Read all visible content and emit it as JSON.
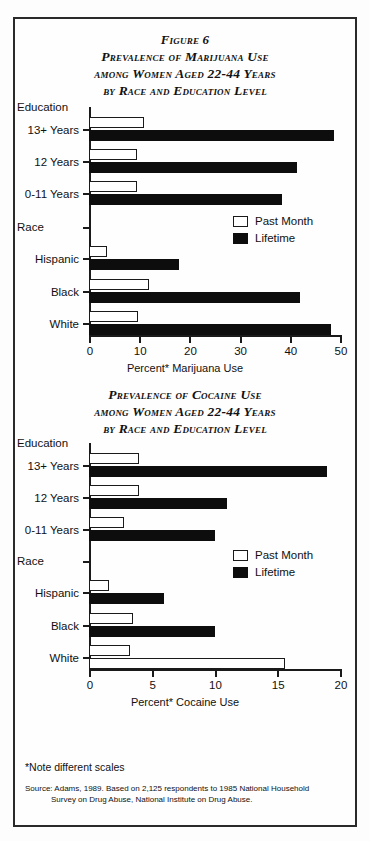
{
  "figure": {
    "number_label": "Figure 6",
    "title_lines": [
      "Prevalence of Marijuana Use",
      "among Women Aged 22-44 Years",
      "by Race and Education Level"
    ]
  },
  "chart2_title_lines": [
    "Prevalence of Cocaine Use",
    "among Women Aged 22-44 Years",
    "by Race and Education Level"
  ],
  "legend": {
    "past_month": "Past Month",
    "lifetime": "Lifetime"
  },
  "groups": {
    "education": "Education",
    "race": "Race"
  },
  "notes": {
    "scales_note": "*Note different scales",
    "source_lead": "Source: Adams, 1989. Based on 2,125 respondents to 1985 National Household",
    "source_cont": "Survey on Drug Abuse, National Institute on Drug Abuse."
  },
  "colors": {
    "lifetime_fill": "#0d0d0d",
    "past_month_fill": "#ffffff",
    "axis": "#1a1a1a",
    "frame": "#2a2a2a"
  },
  "chart_data": [
    {
      "type": "bar",
      "orientation": "horizontal",
      "title": "Prevalence of Marijuana Use among Women Aged 22-44 Years by Race and Education Level",
      "xlabel": "Percent* Marijuana Use",
      "ylabel": "",
      "xlim": [
        0,
        50
      ],
      "xticks": [
        0,
        10,
        20,
        30,
        40,
        50
      ],
      "xtick_labels": [
        "0",
        "10",
        "20",
        "30",
        "40",
        "50"
      ],
      "grid": false,
      "legend_position": "upper right",
      "group_headers": [
        "Education",
        "Race"
      ],
      "categories": [
        "13+ Years",
        "12 Years",
        "0-11 Years",
        "Hispanic",
        "Black",
        "White"
      ],
      "category_groups": [
        "Education",
        "Education",
        "Education",
        "Race",
        "Race",
        "Race"
      ],
      "series": [
        {
          "name": "Past Month",
          "values": [
            11.0,
            9.5,
            9.5,
            3.5,
            12.0,
            9.7
          ]
        },
        {
          "name": "Lifetime",
          "values": [
            48.8,
            41.5,
            38.5,
            18.0,
            42.0,
            48.3
          ]
        }
      ]
    },
    {
      "type": "bar",
      "orientation": "horizontal",
      "title": "Prevalence of Cocaine Use among Women Aged 22-44 Years by Race and Education Level",
      "xlabel": "Percent* Cocaine Use",
      "ylabel": "",
      "xlim": [
        0,
        20
      ],
      "xticks": [
        0,
        5,
        10,
        15,
        20
      ],
      "xtick_labels": [
        "0",
        "5",
        "10",
        "15",
        "20"
      ],
      "grid": false,
      "legend_position": "upper right",
      "group_headers": [
        "Education",
        "Race"
      ],
      "categories": [
        "13+ Years",
        "12 Years",
        "0-11 Years",
        "Hispanic",
        "Black",
        "White"
      ],
      "category_groups": [
        "Education",
        "Education",
        "Education",
        "Race",
        "Race",
        "Race"
      ],
      "series": [
        {
          "name": "Past Month",
          "values": [
            4.0,
            4.0,
            2.8,
            1.6,
            3.5,
            3.3
          ]
        },
        {
          "name": "Lifetime",
          "values": [
            19.0,
            11.0,
            10.0,
            6.0,
            10.0,
            15.6
          ]
        }
      ],
      "render_notes": {
        "hollow_lifetime_bars": [
          "White"
        ]
      }
    }
  ]
}
